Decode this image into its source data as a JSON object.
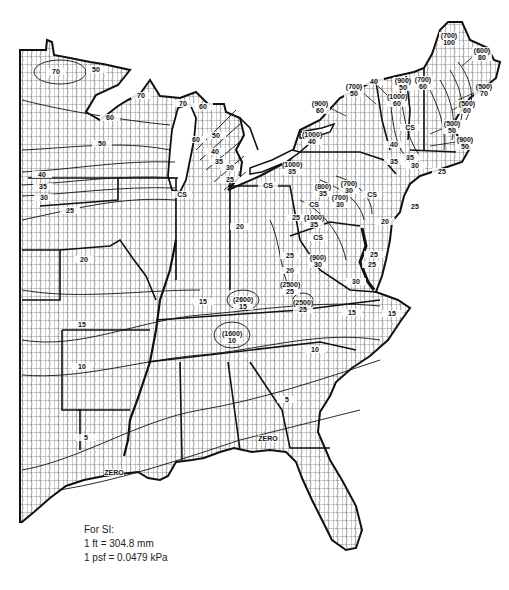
{
  "figure": {
    "type": "ground snow load map",
    "region": "Eastern United States",
    "units": "psf",
    "colors": {
      "ink": "#111111",
      "paper": "#ffffff",
      "county_lines": "#333333"
    }
  },
  "contour_labels": [
    {
      "text": "70",
      "x": 56,
      "y": 72
    },
    {
      "text": "50",
      "x": 96,
      "y": 70
    },
    {
      "text": "60",
      "x": 110,
      "y": 118
    },
    {
      "text": "50",
      "x": 102,
      "y": 144
    },
    {
      "text": "40",
      "x": 42,
      "y": 175
    },
    {
      "text": "35",
      "x": 43,
      "y": 187
    },
    {
      "text": "30",
      "x": 44,
      "y": 198
    },
    {
      "text": "25",
      "x": 70,
      "y": 211
    },
    {
      "text": "20",
      "x": 84,
      "y": 260
    },
    {
      "text": "15",
      "x": 82,
      "y": 325
    },
    {
      "text": "10",
      "x": 82,
      "y": 367
    },
    {
      "text": "5",
      "x": 86,
      "y": 438
    },
    {
      "text": "ZERO",
      "x": 114,
      "y": 473
    },
    {
      "text": "70",
      "x": 141,
      "y": 96
    },
    {
      "text": "70",
      "x": 183,
      "y": 104
    },
    {
      "text": "60",
      "x": 203,
      "y": 107
    },
    {
      "text": "60",
      "x": 196,
      "y": 140
    },
    {
      "text": "50",
      "x": 216,
      "y": 136
    },
    {
      "text": "40",
      "x": 215,
      "y": 152
    },
    {
      "text": "35",
      "x": 219,
      "y": 162
    },
    {
      "text": "30",
      "x": 230,
      "y": 168
    },
    {
      "text": "25",
      "x": 230,
      "y": 180
    },
    {
      "text": "CS",
      "x": 182,
      "y": 195
    },
    {
      "text": "CS",
      "x": 268,
      "y": 186
    },
    {
      "text": "20",
      "x": 240,
      "y": 227
    },
    {
      "text": "25",
      "x": 296,
      "y": 218
    },
    {
      "text": "20",
      "x": 290,
      "y": 271
    },
    {
      "text": "25",
      "x": 290,
      "y": 256
    },
    {
      "text": "15",
      "x": 203,
      "y": 302
    },
    {
      "text": "(2600)\n15",
      "x": 243,
      "y": 300
    },
    {
      "text": "(2500)\n25",
      "x": 290,
      "y": 285
    },
    {
      "text": "(2500)\n25",
      "x": 303,
      "y": 303
    },
    {
      "text": "(1600)\n10",
      "x": 232,
      "y": 334
    },
    {
      "text": "(900)\n30",
      "x": 318,
      "y": 258
    },
    {
      "text": "CS",
      "x": 318,
      "y": 238
    },
    {
      "text": "(1000)\n35",
      "x": 314,
      "y": 218
    },
    {
      "text": "CS",
      "x": 314,
      "y": 205
    },
    {
      "text": "(800)\n35",
      "x": 323,
      "y": 187
    },
    {
      "text": "(700)\n30",
      "x": 349,
      "y": 184
    },
    {
      "text": "(700)\n30",
      "x": 340,
      "y": 198
    },
    {
      "text": "CS",
      "x": 372,
      "y": 195
    },
    {
      "text": "25",
      "x": 372,
      "y": 265
    },
    {
      "text": "30",
      "x": 356,
      "y": 282
    },
    {
      "text": "25",
      "x": 374,
      "y": 255
    },
    {
      "text": "20",
      "x": 385,
      "y": 222
    },
    {
      "text": "25",
      "x": 415,
      "y": 207
    },
    {
      "text": "15",
      "x": 352,
      "y": 313
    },
    {
      "text": "15",
      "x": 392,
      "y": 314
    },
    {
      "text": "10",
      "x": 315,
      "y": 350
    },
    {
      "text": "5",
      "x": 287,
      "y": 400
    },
    {
      "text": "ZERO",
      "x": 268,
      "y": 439
    },
    {
      "text": "(1000)\n40",
      "x": 312,
      "y": 135
    },
    {
      "text": "(1000)\n35",
      "x": 292,
      "y": 165
    },
    {
      "text": "(900)\n60",
      "x": 320,
      "y": 104
    },
    {
      "text": "(700)\n50",
      "x": 354,
      "y": 87
    },
    {
      "text": "40",
      "x": 374,
      "y": 82
    },
    {
      "text": "(900)\n50",
      "x": 403,
      "y": 81
    },
    {
      "text": "(1000)\n60",
      "x": 397,
      "y": 97
    },
    {
      "text": "(700)\n60",
      "x": 423,
      "y": 80
    },
    {
      "text": "(700)\n100",
      "x": 449,
      "y": 36
    },
    {
      "text": "(600)\n80",
      "x": 482,
      "y": 51
    },
    {
      "text": "(500)\n70",
      "x": 484,
      "y": 87
    },
    {
      "text": "(500)\n60",
      "x": 467,
      "y": 104
    },
    {
      "text": "(500)\n50",
      "x": 452,
      "y": 124
    },
    {
      "text": "(900)\n50",
      "x": 465,
      "y": 140
    },
    {
      "text": "CS",
      "x": 410,
      "y": 128
    },
    {
      "text": "40",
      "x": 394,
      "y": 145
    },
    {
      "text": "35",
      "x": 410,
      "y": 158
    },
    {
      "text": "30",
      "x": 415,
      "y": 166
    },
    {
      "text": "35",
      "x": 394,
      "y": 162
    },
    {
      "text": "25",
      "x": 442,
      "y": 172
    }
  ],
  "si_note": {
    "heading": "For SI:",
    "lines": [
      "1 ft = 304.8 mm",
      "1 psf = 0.0479 kPa"
    ]
  }
}
